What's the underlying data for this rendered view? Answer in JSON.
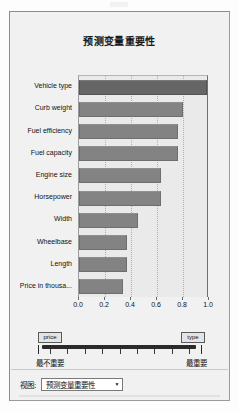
{
  "panel": {
    "title": "预测变量重要性"
  },
  "chart_data": {
    "type": "bar",
    "orientation": "horizontal",
    "title": "预测变量重要性",
    "xlabel": "",
    "ylabel": "",
    "xlim": [
      0.0,
      1.0
    ],
    "grid": true,
    "legend": null,
    "categories": [
      "Vehicle type",
      "Curb weight",
      "Fuel efficiency",
      "Fuel capacity",
      "Engine size",
      "Horsepower",
      "Width",
      "Wheelbase",
      "Length",
      "Price in thousa..."
    ],
    "values": [
      1.0,
      0.8,
      0.76,
      0.76,
      0.63,
      0.63,
      0.45,
      0.37,
      0.37,
      0.34
    ],
    "xticks": [
      "0.0",
      "0.2",
      "0.4",
      "0.6",
      "0.8",
      "1.0"
    ],
    "xtick_values": [
      0.0,
      0.2,
      0.4,
      0.6,
      0.8,
      1.0
    ],
    "bar_color": "#838383",
    "highlight_color": "#666666",
    "plot_background": "#eaeaea"
  },
  "slider": {
    "left_handle_label": "price",
    "right_handle_label": "type",
    "left_caption": "最不重要",
    "right_caption": "最重要",
    "tick_count": 9
  },
  "footer": {
    "label": "视图:",
    "selected_view": "预测变量重要性",
    "arrow": "▼"
  }
}
